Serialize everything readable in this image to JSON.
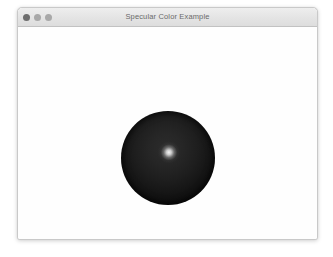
{
  "desktop": {
    "background_color": "#ffffff"
  },
  "window": {
    "title": "Specular Color Example",
    "controls": [
      {
        "name": "close",
        "icon": "close-traffic-light",
        "color": "#6e6e6e"
      },
      {
        "name": "minimize",
        "icon": "minimize-traffic-light",
        "color": "#a8a8a8"
      },
      {
        "name": "maximize",
        "icon": "maximize-traffic-light",
        "color": "#a8a8a8"
      }
    ],
    "titlebar_color": "#e4e4e4",
    "title_text_color": "#6a6a6a",
    "border_color": "#c9c9c9"
  },
  "canvas": {
    "background_color": "#fefefe",
    "object": {
      "name": "sphere",
      "shape": "sphere",
      "base_color": "#000000",
      "diffuse_color": "#1e1e1e",
      "specular_color": "#ffffff",
      "highlight_position": "upper-center",
      "diameter_px": 94
    }
  }
}
